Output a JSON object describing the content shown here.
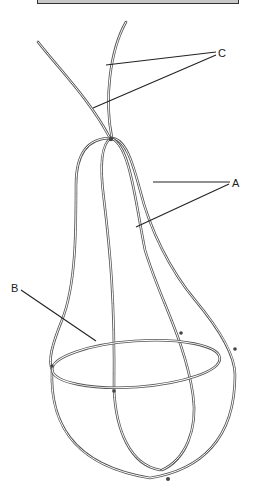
{
  "figure": {
    "header_box": {
      "color": "#c8c8c8",
      "border": "#333333"
    },
    "labels": {
      "a": "A",
      "b": "B",
      "c": "C"
    },
    "callouts": [
      {
        "label": "A",
        "refers_to": "vertical loop wires"
      },
      {
        "label": "B",
        "refers_to": "horizontal ring wire"
      },
      {
        "label": "C",
        "refers_to": "stem wires"
      }
    ],
    "colors": {
      "wire": "#555555",
      "leader": "#222222",
      "background": "#ffffff"
    }
  }
}
